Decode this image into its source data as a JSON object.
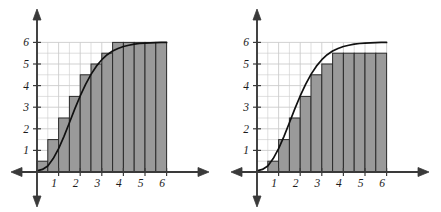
{
  "figure_count": 2,
  "chart_data": [
    {
      "id": "left",
      "type": "bar",
      "title": "",
      "subtitle": "",
      "xlabel": "",
      "ylabel": "",
      "description": "Upper (right-endpoint) Riemann sum rectangles circumscribing a sigmoid curve",
      "grid": true,
      "grid_step": 0.5,
      "legend": "none",
      "xlim": [
        0,
        6
      ],
      "ylim": [
        0,
        6
      ],
      "x_ticks": [
        1,
        2,
        3,
        4,
        5,
        6
      ],
      "y_ticks": [
        1,
        2,
        3,
        4,
        5,
        6
      ],
      "x_tick_labels": [
        "1",
        "2",
        "3",
        "4",
        "5",
        "6"
      ],
      "y_tick_labels": [
        "1",
        "2",
        "3",
        "4",
        "5",
        "6"
      ],
      "axis_arrows": [
        "left",
        "right",
        "up",
        "down"
      ],
      "bar_width": 0.5,
      "bar_start": 0.0,
      "endpoint_rule": "right",
      "categories": [
        "0.0-0.5",
        "0.5-1.0",
        "1.0-1.5",
        "1.5-2.0",
        "2.0-2.5",
        "2.5-3.0",
        "3.0-3.5",
        "3.5-4.0",
        "4.0-4.5",
        "4.5-5.0",
        "5.0-5.5",
        "5.5-6.0"
      ],
      "bar_left_edges": [
        0.0,
        0.5,
        1.0,
        1.5,
        2.0,
        2.5,
        3.0,
        3.5,
        4.0,
        4.5,
        5.0,
        5.5
      ],
      "values": [
        0.5,
        1.5,
        2.5,
        3.5,
        4.5,
        5.0,
        5.5,
        6.0,
        6.0,
        6.0,
        6.0,
        6.0
      ],
      "curve": {
        "name": "f(x)",
        "shape": "sigmoid",
        "asymptote": 6,
        "inflection_x": 2.5,
        "x": [
          0.0,
          0.25,
          0.5,
          0.75,
          1.0,
          1.25,
          1.5,
          1.75,
          2.0,
          2.25,
          2.5,
          2.75,
          3.0,
          3.25,
          3.5,
          3.75,
          4.0,
          4.25,
          4.5,
          4.75,
          5.0,
          5.25,
          5.5,
          5.75,
          6.0
        ],
        "y": [
          0.05,
          0.12,
          0.28,
          0.62,
          1.08,
          1.65,
          2.28,
          2.92,
          3.52,
          4.06,
          4.52,
          4.9,
          5.2,
          5.43,
          5.6,
          5.72,
          5.81,
          5.87,
          5.92,
          5.95,
          5.97,
          5.98,
          5.99,
          6.0,
          6.0
        ]
      }
    },
    {
      "id": "right",
      "type": "bar",
      "title": "",
      "subtitle": "",
      "xlabel": "",
      "ylabel": "",
      "description": "Lower (left-endpoint) Riemann sum rectangles inscribed beneath a sigmoid curve",
      "grid": true,
      "grid_step": 0.5,
      "legend": "none",
      "xlim": [
        0,
        6
      ],
      "ylim": [
        0,
        6
      ],
      "x_ticks": [
        1,
        2,
        3,
        4,
        5,
        6
      ],
      "y_ticks": [
        1,
        2,
        3,
        4,
        5,
        6
      ],
      "x_tick_labels": [
        "1",
        "2",
        "3",
        "4",
        "5",
        "6"
      ],
      "y_tick_labels": [
        "1",
        "2",
        "3",
        "4",
        "5",
        "6"
      ],
      "axis_arrows": [
        "left",
        "right",
        "up",
        "down"
      ],
      "bar_width": 0.5,
      "bar_start": 0.5,
      "endpoint_rule": "left",
      "categories": [
        "0.5-1.0",
        "1.0-1.5",
        "1.5-2.0",
        "2.0-2.5",
        "2.5-3.0",
        "3.0-3.5",
        "3.5-4.0",
        "4.0-4.5",
        "4.5-5.0",
        "5.0-5.5",
        "5.5-6.0"
      ],
      "bar_left_edges": [
        0.5,
        1.0,
        1.5,
        2.0,
        2.5,
        3.0,
        3.5,
        4.0,
        4.5,
        5.0,
        5.5
      ],
      "values": [
        0.5,
        1.5,
        2.5,
        3.5,
        4.5,
        5.0,
        5.5,
        5.5,
        5.5,
        5.5,
        5.5
      ],
      "curve": {
        "name": "f(x)",
        "shape": "sigmoid",
        "asymptote": 6,
        "inflection_x": 2.5,
        "x": [
          0.0,
          0.25,
          0.5,
          0.75,
          1.0,
          1.25,
          1.5,
          1.75,
          2.0,
          2.25,
          2.5,
          2.75,
          3.0,
          3.25,
          3.5,
          3.75,
          4.0,
          4.25,
          4.5,
          4.75,
          5.0,
          5.25,
          5.5,
          5.75,
          6.0
        ],
        "y": [
          0.05,
          0.12,
          0.28,
          0.62,
          1.08,
          1.65,
          2.28,
          2.92,
          3.52,
          4.06,
          4.52,
          4.9,
          5.2,
          5.43,
          5.6,
          5.72,
          5.81,
          5.87,
          5.92,
          5.95,
          5.97,
          5.98,
          5.99,
          6.0,
          6.0
        ]
      }
    }
  ],
  "style": {
    "bar_fill": "#9a9a9a",
    "bar_stroke": "#2b2b2b",
    "curve_color": "#111111",
    "axis_color": "#3a3a3a",
    "grid_color": "#c9c9c9",
    "label_color": "#1b1b1b",
    "background": "#ffffff"
  }
}
